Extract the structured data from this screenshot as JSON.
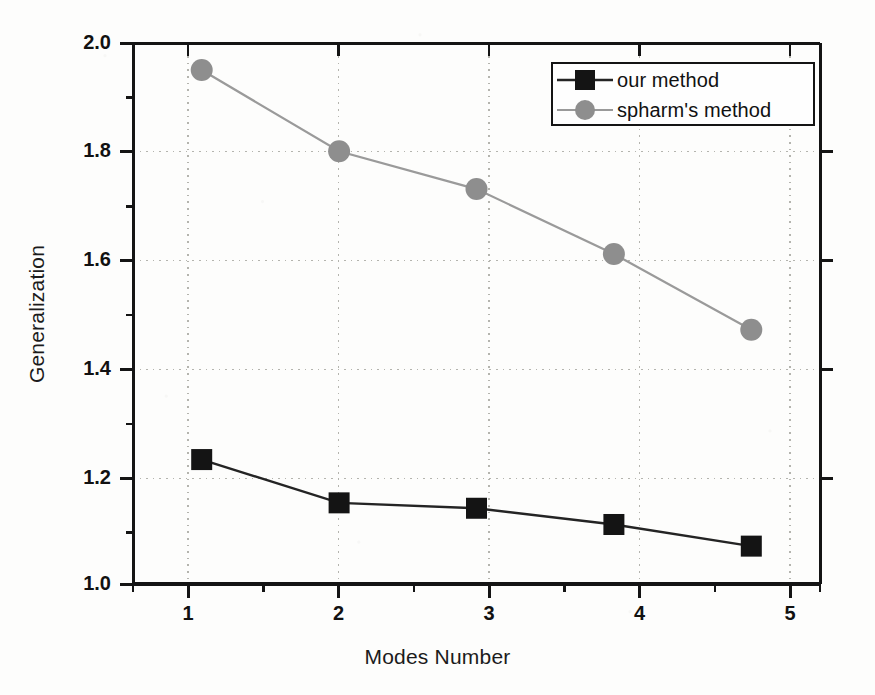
{
  "chart_data": {
    "type": "line",
    "title": "",
    "xlabel": "Modes Number",
    "ylabel": "Generalization",
    "x": [
      1,
      2,
      3,
      4,
      5
    ],
    "xlim": [
      0.5,
      5.5
    ],
    "ylim": [
      1.0,
      2.0
    ],
    "xticks": [
      "1",
      "2",
      "3",
      "4",
      "5"
    ],
    "yticks": [
      "1.0",
      "1.2",
      "1.4",
      "1.6",
      "1.8",
      "2.0"
    ],
    "x_minor_tick_interval": 0.5,
    "y_minor_tick_interval": 0.1,
    "grid": "dotted gridlines on both major x and major y",
    "legend_position": "top-right inside axes",
    "series": [
      {
        "name": "our method",
        "values": [
          1.23,
          1.15,
          1.14,
          1.11,
          1.07
        ],
        "marker": "filled-square",
        "color": "#141414",
        "line_color": "#242424"
      },
      {
        "name": "spharm's method",
        "values": [
          1.95,
          1.8,
          1.73,
          1.61,
          1.47
        ],
        "marker": "filled-circle",
        "color": "#8e8e8e",
        "line_color": "#9a9a9a"
      }
    ]
  },
  "axes": {
    "y_title": "Generalization",
    "x_title": "Modes Number",
    "y_tick_labels": [
      "2.0",
      "1.8",
      "1.6",
      "1.4",
      "1.2",
      "1.0"
    ],
    "x_tick_labels": [
      "1",
      "2",
      "3",
      "4",
      "5"
    ]
  },
  "legend": {
    "entries": [
      {
        "label": "our method",
        "marker": "filled-square",
        "color": "#141414"
      },
      {
        "label": "spharm's method",
        "marker": "filled-circle",
        "color": "#8e8e8e"
      }
    ]
  },
  "colors": {
    "series_our_method": "#141414",
    "series_spharm_method": "#8e8e8e",
    "axis": "#141414",
    "grid": "#b4b4ae",
    "background": "#fdfdfc",
    "text": "#111111"
  }
}
